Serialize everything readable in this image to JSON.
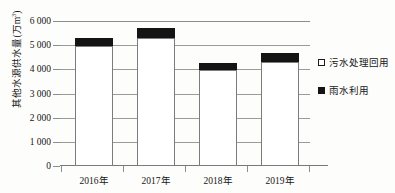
{
  "chart_data": {
    "type": "bar",
    "stacked": true,
    "title": "",
    "xlabel": "",
    "ylabel": "其他水源供水量(万m³)",
    "ylabel_main": "其他水源供水量(万m",
    "ylabel_sup": "3",
    "ylabel_tail": ")",
    "categories": [
      "2016年",
      "2017年",
      "2018年",
      "2019年"
    ],
    "ylim": [
      0,
      6000
    ],
    "ytick_labels": [
      "0",
      "1 000",
      "2 000",
      "3 000",
      "4 000",
      "5 000",
      "6 000"
    ],
    "ytick_values": [
      0,
      1000,
      2000,
      3000,
      4000,
      5000,
      6000
    ],
    "grid": true,
    "legend_position": "right",
    "series": [
      {
        "name": "污水处理回用",
        "swatch": "open-square",
        "values": [
          4950,
          5280,
          3980,
          4320
        ]
      },
      {
        "name": "雨水利用",
        "swatch": "filled-square",
        "values": [
          350,
          420,
          300,
          340
        ]
      }
    ],
    "totals": [
      5300,
      5700,
      4280,
      4660
    ]
  },
  "colors": {
    "fill_reclaimed": "#ffffff",
    "fill_rainwater": "#141414",
    "gridline": "#9a9a9a",
    "axis": "#777777",
    "text": "#141414",
    "background": "#fdfdfb"
  },
  "legend": {
    "items": [
      {
        "label": "污水处理回用",
        "swatch": "open-square"
      },
      {
        "label": "雨水利用",
        "swatch": "filled-square"
      }
    ]
  }
}
